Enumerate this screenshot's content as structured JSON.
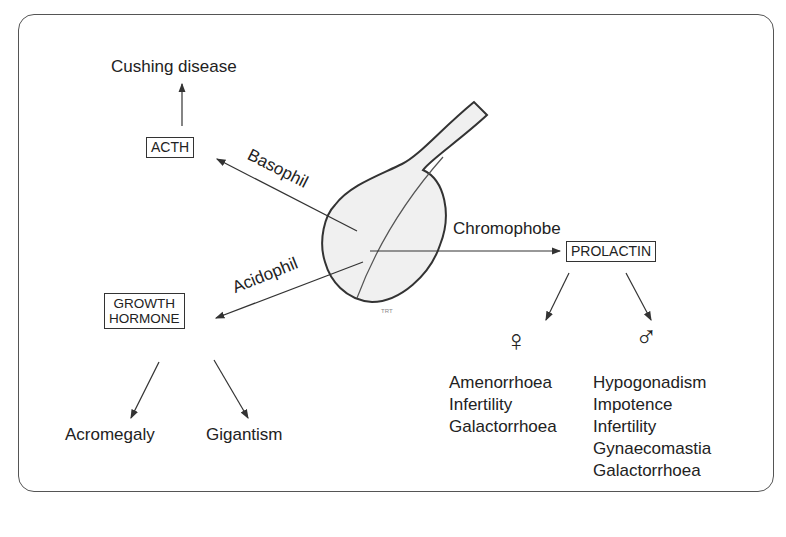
{
  "diagram": {
    "center": {
      "label": "Pituitary gland",
      "signature": "TRT"
    },
    "cell_types": {
      "basophil": "Basophil",
      "acidophil": "Acidophil",
      "chromophobe": "Chromophobe"
    },
    "hormones": {
      "acth": "ACTH",
      "growth_hormone_line1": "GROWTH",
      "growth_hormone_line2": "HORMONE",
      "prolactin": "PROLACTIN"
    },
    "effects": {
      "acth": [
        "Cushing disease"
      ],
      "growth_hormone": [
        "Acromegaly",
        "Gigantism"
      ],
      "prolactin_female": {
        "symbol": "♀",
        "items": [
          "Amenorrhoea",
          "Infertility",
          "Galactorrhoea"
        ]
      },
      "prolactin_male": {
        "symbol": "♂",
        "items": [
          "Hypogonadism",
          "Impotence",
          "Infertility",
          "Gynaecomastia",
          "Galactorrhoea"
        ]
      }
    },
    "colors": {
      "line": "#333333",
      "gland_fill": "#f0f0f0",
      "frame": "#555555"
    }
  }
}
